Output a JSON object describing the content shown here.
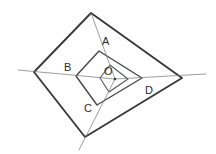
{
  "figure": {
    "background_color": "#ffffff",
    "stroke_color_outer": "#3a3a3a",
    "stroke_color_middle": "#4a4a4a",
    "stroke_color_inner": "#5a5a5a",
    "stroke_color_rays": "#7e7e7e",
    "label_color": "#2b2b2b",
    "width": 216,
    "height": 154
  },
  "labels": {
    "a": "A",
    "b": "B",
    "c": "C",
    "d": "D",
    "o": "O"
  },
  "chart_data": {
    "type": "diagram",
    "coordinate_space": {
      "width": 216,
      "height": 154,
      "origin": "top-left",
      "units": "pixels"
    },
    "points": [
      {
        "name": "O",
        "x": 115,
        "y": 79,
        "label": "O",
        "label_x": 104,
        "label_y": 66,
        "on": "center"
      },
      {
        "name": "A",
        "x": 99,
        "y": 51,
        "label": "A",
        "label_x": 102,
        "label_y": 36,
        "on": "middle-quadrilateral"
      },
      {
        "name": "B",
        "x": 76,
        "y": 76,
        "label": "B",
        "label_x": 64,
        "label_y": 62,
        "on": "middle-quadrilateral"
      },
      {
        "name": "C",
        "x": 97,
        "y": 105,
        "label": "C",
        "label_x": 84,
        "label_y": 103,
        "on": "middle-quadrilateral"
      },
      {
        "name": "D",
        "x": 142,
        "y": 78,
        "label": "D",
        "label_x": 145,
        "label_y": 85,
        "on": "middle-quadrilateral"
      }
    ],
    "polygons": [
      {
        "name": "outer-quadrilateral",
        "stroke": "#3a3a3a",
        "stroke_width": 1.9,
        "closed": true,
        "vertices": [
          {
            "x": 91,
            "y": 13
          },
          {
            "x": 182,
            "y": 78
          },
          {
            "x": 85,
            "y": 137
          },
          {
            "x": 34,
            "y": 72
          }
        ]
      },
      {
        "name": "middle-quadrilateral",
        "stroke": "#4a4a4a",
        "stroke_width": 1.45,
        "closed": true,
        "vertices": [
          {
            "x": 99,
            "y": 51
          },
          {
            "x": 142,
            "y": 78
          },
          {
            "x": 97,
            "y": 105
          },
          {
            "x": 76,
            "y": 76
          }
        ]
      },
      {
        "name": "inner-quadrilateral",
        "stroke": "#5a5a5a",
        "stroke_width": 1.15,
        "closed": true,
        "vertices": [
          {
            "x": 110,
            "y": 65
          },
          {
            "x": 128,
            "y": 79
          },
          {
            "x": 109,
            "y": 92
          },
          {
            "x": 100,
            "y": 78
          }
        ]
      }
    ],
    "rays": [
      {
        "name": "ray-top",
        "from": {
          "x": 91,
          "y": 13
        },
        "to": {
          "x": 115,
          "y": 79
        },
        "passes_through": [
          "A"
        ],
        "stroke": "#7e7e7e",
        "stroke_width": 0.75
      },
      {
        "name": "ray-left",
        "from": {
          "x": 18,
          "y": 70
        },
        "to": {
          "x": 115,
          "y": 79
        },
        "passes_through": [
          "B"
        ],
        "stroke": "#7e7e7e",
        "stroke_width": 0.75
      },
      {
        "name": "ray-right",
        "from": {
          "x": 115,
          "y": 79
        },
        "to": {
          "x": 206,
          "y": 74
        },
        "passes_through": [
          "D"
        ],
        "stroke": "#7e7e7e",
        "stroke_width": 0.75
      },
      {
        "name": "ray-bottom",
        "from": {
          "x": 115,
          "y": 79
        },
        "to": {
          "x": 79,
          "y": 150
        },
        "passes_through": [
          "C"
        ],
        "stroke": "#7e7e7e",
        "stroke_width": 0.75
      }
    ]
  }
}
